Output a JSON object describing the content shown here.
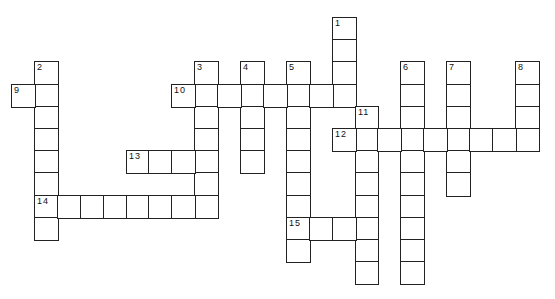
{
  "puzzle": {
    "origin": {
      "x": 11,
      "y": 17
    },
    "cell_width": 22.9,
    "cell_height": 22.2,
    "line_color": "#222222",
    "entries": [
      {
        "number": "1",
        "direction": "down",
        "col": 14,
        "row": 0,
        "length": 4
      },
      {
        "number": "2",
        "direction": "down",
        "col": 1,
        "row": 2,
        "length": 8
      },
      {
        "number": "3",
        "direction": "down",
        "col": 8,
        "row": 2,
        "length": 7
      },
      {
        "number": "4",
        "direction": "down",
        "col": 10,
        "row": 2,
        "length": 5
      },
      {
        "number": "5",
        "direction": "down",
        "col": 12,
        "row": 2,
        "length": 9
      },
      {
        "number": "6",
        "direction": "down",
        "col": 17,
        "row": 2,
        "length": 10
      },
      {
        "number": "7",
        "direction": "down",
        "col": 19,
        "row": 2,
        "length": 6
      },
      {
        "number": "8",
        "direction": "down",
        "col": 22,
        "row": 2,
        "length": 4
      },
      {
        "number": "9",
        "direction": "across",
        "col": 0,
        "row": 3,
        "length": 2
      },
      {
        "number": "10",
        "direction": "across",
        "col": 7,
        "row": 3,
        "length": 8
      },
      {
        "number": "11",
        "direction": "down",
        "col": 15,
        "row": 4,
        "length": 8
      },
      {
        "number": "12",
        "direction": "across",
        "col": 14,
        "row": 5,
        "length": 9
      },
      {
        "number": "13",
        "direction": "across",
        "col": 5,
        "row": 6,
        "length": 4
      },
      {
        "number": "14",
        "direction": "across",
        "col": 1,
        "row": 8,
        "length": 8
      },
      {
        "number": "15",
        "direction": "across",
        "col": 12,
        "row": 9,
        "length": 4
      }
    ]
  }
}
